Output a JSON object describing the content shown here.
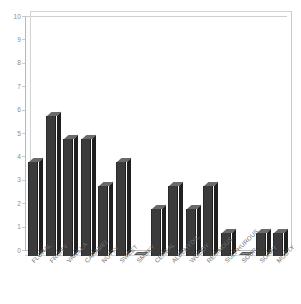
{
  "chart_data": {
    "type": "bar",
    "title": "",
    "subtitle": "",
    "xlabel": "",
    "ylabel": "",
    "ylim": [
      0,
      10
    ],
    "ytick_labels": [
      "10",
      "9",
      "8",
      "7",
      "6",
      "5",
      "4",
      "3",
      "2",
      "1",
      "0"
    ],
    "ytick_values": [
      10,
      9,
      8,
      7,
      6,
      5,
      4,
      3,
      2,
      1,
      0
    ],
    "grid": false,
    "legend": null,
    "legend_position": "none",
    "annotations": [],
    "style": "3d-column",
    "categories": [
      "FLORAL",
      "FRUITY",
      "VANILLA",
      "CARAMEL",
      "NUTTY",
      "SWEET",
      "SMOKY",
      "CEREAL",
      "ALDEHYDIC",
      "WOODY",
      "RESINOUS",
      "SULPHUROUS",
      "SOUR",
      "SOAPY",
      "MUSTY"
    ],
    "values": [
      4,
      6,
      5,
      5,
      3,
      4,
      0,
      2,
      3,
      2,
      3,
      1,
      0,
      1,
      1
    ]
  },
  "colors": {
    "bar_front": "#3b3b3b",
    "bar_top": "#6a6a6a",
    "bar_side": "#202020",
    "axis_text": "#8d8d8d",
    "category_text": "#6f6f6f",
    "frame": "#c9c9c9",
    "background": "#ffffff"
  }
}
